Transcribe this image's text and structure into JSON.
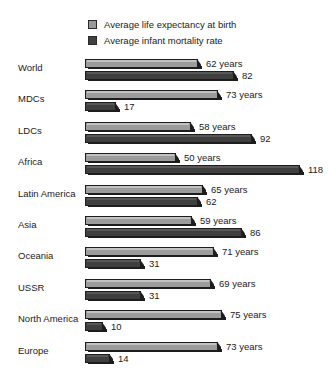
{
  "legend": {
    "items": [
      {
        "label": "Average life expectancy at birth",
        "swatch": "legend-swatch-light",
        "color": "#9c9c9c"
      },
      {
        "label": "Average infant mortality rate",
        "swatch": "legend-swatch-dark",
        "color": "#3f3f3f"
      }
    ]
  },
  "chart_data": {
    "type": "bar",
    "orientation": "horizontal",
    "title": "",
    "subtitle": "",
    "xlabel": "",
    "ylabel": "",
    "grid": false,
    "legend_position": "top",
    "axis_visible": false,
    "xlim": [
      0,
      118
    ],
    "categories": [
      "World",
      "MDCs",
      "LDCs",
      "Africa",
      "Latin America",
      "Asia",
      "Oceania",
      "USSR",
      "North America",
      "Europe"
    ],
    "series": [
      {
        "name": "Average life expectancy at birth",
        "unit": "years",
        "color": "#9c9c9c",
        "values": [
          62,
          73,
          58,
          50,
          65,
          59,
          71,
          69,
          75,
          73
        ],
        "labels": [
          "62 years",
          "73 years",
          "58 years",
          "50 years",
          "65 years",
          "59 years",
          "71 years",
          "69 years",
          "75 years",
          "73 years"
        ]
      },
      {
        "name": "Average infant mortality rate",
        "unit": "",
        "color": "#3f3f3f",
        "values": [
          82,
          17,
          92,
          118,
          62,
          86,
          31,
          31,
          10,
          14
        ],
        "labels": [
          "82",
          "17",
          "92",
          "118",
          "62",
          "86",
          "31",
          "31",
          "10",
          "14"
        ]
      }
    ]
  }
}
